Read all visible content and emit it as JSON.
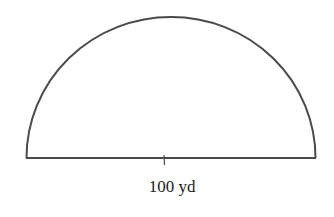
{
  "figure": {
    "shape": "semicircle",
    "diameter_label": "100 yd",
    "diameter_value": 100,
    "diameter_unit": "yd",
    "stroke_color": "#4a4a4a",
    "background": "#ffffff"
  }
}
